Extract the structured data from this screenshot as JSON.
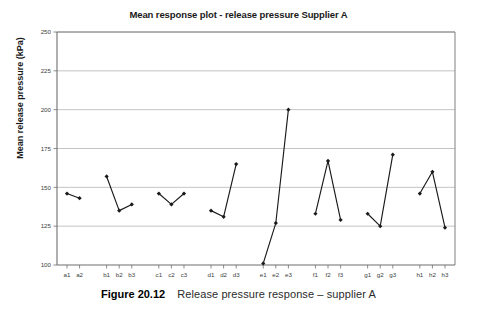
{
  "figure": {
    "caption_number": "Figure 20.12",
    "caption_text": "Release pressure response – supplier A"
  },
  "chart_data": {
    "type": "line",
    "title": "Mean response plot - release pressure Supplier A",
    "xlabel": "",
    "ylabel": "Mean release pressure (kPa)",
    "ylim": [
      100,
      250
    ],
    "yticks": [
      100,
      125,
      150,
      175,
      200,
      225,
      250
    ],
    "ytick_labels": [
      "100",
      "125",
      "150",
      "175",
      "200",
      "225",
      "250"
    ],
    "grid": "horizontal",
    "legend": "none",
    "marker": "filled-diamond",
    "line_color": "#1a1a1a",
    "grid_color": "#b5b5b5",
    "axis_color": "#808080",
    "categories": [
      "a1",
      "a2",
      "b1",
      "b2",
      "b3",
      "c1",
      "c2",
      "c3",
      "d1",
      "d2",
      "d3",
      "e1",
      "e2",
      "e3",
      "f1",
      "f2",
      "f3",
      "g1",
      "g2",
      "g3",
      "h1",
      "h2",
      "h3"
    ],
    "values": [
      146,
      143,
      157,
      135,
      139,
      146,
      139,
      146,
      135,
      131,
      165,
      101,
      127,
      200,
      133,
      167,
      129,
      133,
      125,
      171,
      146,
      160,
      124
    ],
    "groups": [
      {
        "name": "a",
        "categories": [
          "a1",
          "a2"
        ],
        "values": [
          146,
          143
        ]
      },
      {
        "name": "b",
        "categories": [
          "b1",
          "b2",
          "b3"
        ],
        "values": [
          157,
          135,
          139
        ]
      },
      {
        "name": "c",
        "categories": [
          "c1",
          "c2",
          "c3"
        ],
        "values": [
          146,
          139,
          146
        ]
      },
      {
        "name": "d",
        "categories": [
          "d1",
          "d2",
          "d3"
        ],
        "values": [
          135,
          131,
          165
        ]
      },
      {
        "name": "e",
        "categories": [
          "e1",
          "e2",
          "e3"
        ],
        "values": [
          101,
          127,
          200
        ]
      },
      {
        "name": "f",
        "categories": [
          "f1",
          "f2",
          "f3"
        ],
        "values": [
          133,
          167,
          129
        ]
      },
      {
        "name": "g",
        "categories": [
          "g1",
          "g2",
          "g3"
        ],
        "values": [
          133,
          125,
          171
        ]
      },
      {
        "name": "h",
        "categories": [
          "h1",
          "h2",
          "h3"
        ],
        "values": [
          146,
          160,
          124
        ]
      }
    ]
  }
}
